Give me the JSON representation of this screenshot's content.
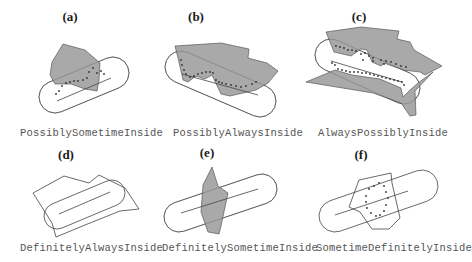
{
  "figure": {
    "colors": {
      "region_fill": "#a9a9a9",
      "stroke": "#444444",
      "caption_text": "#555555",
      "title_text": "#1a1a1a"
    },
    "panels": [
      {
        "id": "a",
        "title": "(a)",
        "caption": "PossiblySometimeInside",
        "title_pos": [
          58,
          9
        ],
        "caption_pos": [
          20,
          127
        ],
        "capsule": {
          "x1": 55,
          "y1": 97,
          "x2": 113,
          "y2": 73,
          "r": 16
        },
        "path_line": {
          "x1": 57,
          "y1": 101,
          "x2": 111,
          "y2": 78
        },
        "region": "63,44 85,50 100,63 99,80 97,91 85,89 71,84 55,84 50,75 52,62",
        "region_filled": true,
        "dots": [
          [
            89,
            72
          ],
          [
            93,
            68
          ],
          [
            97,
            73
          ],
          [
            101,
            71
          ],
          [
            104,
            74
          ],
          [
            87,
            78
          ],
          [
            83,
            80
          ],
          [
            78,
            81
          ],
          [
            74,
            81
          ],
          [
            70,
            82
          ],
          [
            66,
            83
          ],
          [
            62,
            86
          ],
          [
            59,
            91
          ],
          [
            56,
            94
          ]
        ]
      },
      {
        "id": "b",
        "title": "(b)",
        "caption": "PossiblyAlwaysInside",
        "title_pos": [
          184,
          9
        ],
        "caption_pos": [
          173,
          127
        ],
        "capsule": {
          "x1": 181,
          "y1": 67,
          "x2": 260,
          "y2": 101,
          "r": 16
        },
        "path_line": {
          "x1": 182,
          "y1": 74,
          "x2": 258,
          "y2": 95
        },
        "region": "175,46 221,43 249,49 248,58 267,63 278,71 268,83 256,90 230,96 221,94 212,75 205,79 196,76 188,82 183,80 178,58",
        "region_filled": true,
        "dots": [
          [
            181,
            60
          ],
          [
            182,
            65
          ],
          [
            184,
            70
          ],
          [
            186,
            74
          ],
          [
            190,
            77
          ],
          [
            194,
            76
          ],
          [
            198,
            74
          ],
          [
            202,
            73
          ],
          [
            206,
            72
          ],
          [
            210,
            72
          ],
          [
            213,
            73
          ],
          [
            216,
            80
          ],
          [
            219,
            82
          ],
          [
            222,
            83
          ],
          [
            226,
            84
          ],
          [
            231,
            85
          ],
          [
            236,
            86
          ],
          [
            241,
            87
          ],
          [
            246,
            86
          ],
          [
            252,
            84
          ],
          [
            256,
            82
          ]
        ]
      },
      {
        "id": "c",
        "title": "(c)",
        "caption": "AlwaysPossiblyInside",
        "title_pos": [
          347,
          9
        ],
        "caption_pos": [
          318,
          127
        ],
        "capsule": {
          "x1": 331,
          "y1": 55,
          "x2": 404,
          "y2": 88,
          "r": 16
        },
        "path_line": {
          "x1": 331,
          "y1": 61,
          "x2": 402,
          "y2": 82
        },
        "region_upper": "326,32 361,27 399,31 397,39 410,42 414,50 428,58 442,66 425,75 420,72 403,70 384,63 381,66 372,62 367,50 361,49 351,56 334,52",
        "region_lower": "306,82 335,70 352,75 380,79 401,88 403,97 410,90 418,83 433,72 415,91 416,115 410,116 401,103 373,93",
        "region_filled": true,
        "dots": [
          [
            336,
            46
          ],
          [
            340,
            47
          ],
          [
            344,
            48
          ],
          [
            348,
            50
          ],
          [
            352,
            50
          ],
          [
            356,
            51
          ],
          [
            361,
            54
          ],
          [
            365,
            53
          ],
          [
            369,
            56
          ],
          [
            373,
            58
          ],
          [
            381,
            60
          ],
          [
            386,
            61
          ],
          [
            391,
            62
          ],
          [
            396,
            64
          ],
          [
            401,
            66
          ],
          [
            406,
            67
          ],
          [
            338,
            69
          ],
          [
            342,
            70
          ],
          [
            346,
            71
          ],
          [
            350,
            72
          ],
          [
            354,
            72
          ],
          [
            358,
            72
          ],
          [
            362,
            73
          ],
          [
            366,
            73
          ],
          [
            370,
            74
          ],
          [
            374,
            75
          ],
          [
            378,
            76
          ],
          [
            382,
            77
          ],
          [
            386,
            78
          ],
          [
            390,
            79
          ],
          [
            394,
            80
          ],
          [
            398,
            81
          ],
          [
            402,
            82
          ],
          [
            404,
            85
          ],
          [
            332,
            63
          ],
          [
            335,
            65
          ],
          [
            363,
            60
          ],
          [
            373,
            61
          ],
          [
            384,
            64
          ]
        ]
      },
      {
        "id": "d",
        "title": "(d)",
        "caption": "DefinitelyAlwaysInside",
        "title_pos": [
          54,
          147
        ],
        "caption_pos": [
          20,
          242
        ],
        "capsule": {
          "x1": 57,
          "y1": 216,
          "x2": 112,
          "y2": 193,
          "r": 13
        },
        "path_line": {
          "x1": 59,
          "y1": 214,
          "x2": 110,
          "y2": 192
        },
        "region": "33,193 64,176 89,183 99,175 125,188 139,209 120,211 85,225 56,237 52,223",
        "region_filled": false,
        "dots": []
      },
      {
        "id": "e",
        "title": "(e)",
        "caption": "DefinitelySometimeInside",
        "title_pos": [
          195,
          145
        ],
        "caption_pos": [
          162,
          242
        ],
        "capsule": {
          "x1": 179,
          "y1": 217,
          "x2": 262,
          "y2": 189,
          "r": 15
        },
        "path_line": {
          "x1": 181,
          "y1": 213,
          "x2": 258,
          "y2": 189
        },
        "region": "212,167 218,186 228,193 221,226 219,234 208,232 201,212 203,185 207,177",
        "region_filled": true,
        "dots": []
      },
      {
        "id": "f",
        "title": "(f)",
        "caption": "SometimeDefinitelyInside",
        "title_pos": [
          349,
          147
        ],
        "caption_pos": [
          316,
          242
        ],
        "capsule": {
          "x1": 335,
          "y1": 216,
          "x2": 422,
          "y2": 186,
          "r": 16
        },
        "path_line": {
          "x1": 335,
          "y1": 215,
          "x2": 408,
          "y2": 191
        },
        "region": "359,180 391,173 392,183 400,218 389,229 372,229 360,212 349,207",
        "region_filled": false,
        "dots": [
          [
            369,
            189
          ],
          [
            374,
            186
          ],
          [
            379,
            183
          ],
          [
            384,
            186
          ],
          [
            386,
            192
          ],
          [
            388,
            198
          ],
          [
            386,
            205
          ],
          [
            384,
            211
          ],
          [
            380,
            215
          ],
          [
            376,
            216
          ],
          [
            371,
            213
          ],
          [
            367,
            208
          ],
          [
            366,
            202
          ],
          [
            366,
            196
          ]
        ]
      }
    ]
  }
}
